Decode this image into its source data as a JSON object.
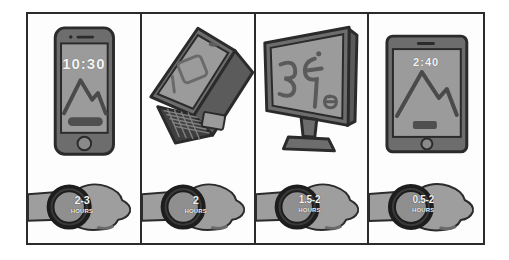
{
  "illustration": {
    "title": "Recommended daily screen time by device",
    "style": "hand-drawn grayscale infographic grid",
    "palette": {
      "ink": "#2b2b2b",
      "device_body": "#6d6d6d",
      "device_screen": "#9b9b9b",
      "skin": "#9e9e9e",
      "skin_shadow": "#8a8a8a",
      "watch_case": "#3a3a3a",
      "watch_face": "#8f8f8f",
      "paper": "#ffffff"
    },
    "grid": {
      "columns": 4,
      "rows": 2
    }
  },
  "devices": [
    {
      "name": "smartphone",
      "icon": "smartphone-icon",
      "screen_text": "10:30",
      "wallpaper": "mountain-wallpaper"
    },
    {
      "name": "laptop",
      "icon": "laptop-icon",
      "screen_text": "",
      "wallpaper": "window-shapes-wallpaper"
    },
    {
      "name": "desktop-monitor",
      "icon": "monitor-icon",
      "screen_text": "",
      "wallpaper": "squiggle-shapes-wallpaper"
    },
    {
      "name": "tablet",
      "icon": "tablet-icon",
      "screen_text": "2:40",
      "wallpaper": "mountain-wallpaper"
    }
  ],
  "durations": [
    {
      "value": "2-3",
      "unit": "HOURS",
      "device": "smartphone"
    },
    {
      "value": "2",
      "unit": "HOURS",
      "device": "laptop"
    },
    {
      "value": "1.5-2",
      "unit": "HOURS",
      "device": "desktop-monitor"
    },
    {
      "value": "0.5-2",
      "unit": "HOURS",
      "device": "tablet"
    }
  ]
}
